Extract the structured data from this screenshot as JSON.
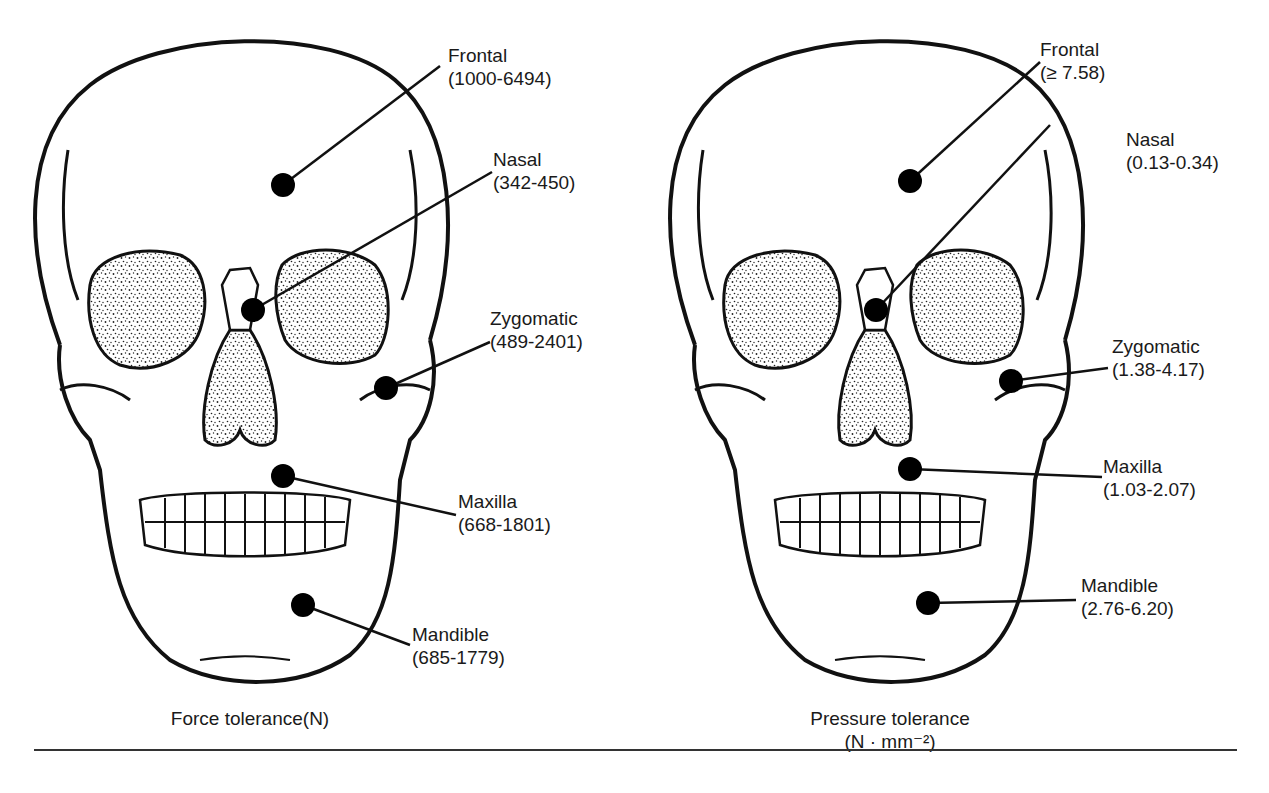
{
  "figure": {
    "panels": [
      {
        "id": "force",
        "caption_line1": "Force tolerance(N)",
        "caption_line2": "",
        "labels": [
          {
            "name": "Frontal",
            "range": "(1000-6494)"
          },
          {
            "name": "Nasal",
            "range": "(342-450)"
          },
          {
            "name": "Zygomatic",
            "range": "(489-2401)"
          },
          {
            "name": "Maxilla",
            "range": "(668-1801)"
          },
          {
            "name": "Mandible",
            "range": "(685-1779)"
          }
        ]
      },
      {
        "id": "pressure",
        "caption_line1": "Pressure tolerance",
        "caption_line2": "(N · mm⁻²)",
        "labels": [
          {
            "name": "Frontal",
            "range": "(≥ 7.58)"
          },
          {
            "name": "Nasal",
            "range": "(0.13-0.34)"
          },
          {
            "name": "Zygomatic",
            "range": "(1.38-4.17)"
          },
          {
            "name": "Maxilla",
            "range": "(1.03-2.07)"
          },
          {
            "name": "Mandible",
            "range": "(2.76-6.20)"
          }
        ]
      }
    ]
  },
  "colors": {
    "ink": "#1a1a1a",
    "background": "#ffffff"
  }
}
